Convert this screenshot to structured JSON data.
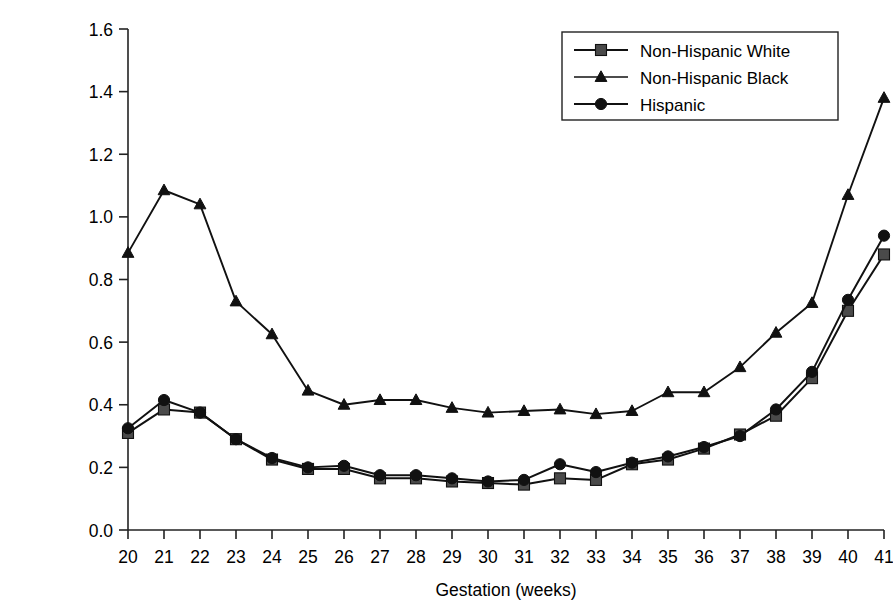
{
  "chart_data": {
    "type": "line",
    "title": "",
    "xlabel": "Gestation (weeks)",
    "ylabel": "Hazard of stillbirth\nper 1,000 ongoing pregnancies",
    "xlim": [
      20,
      41
    ],
    "ylim": [
      0.0,
      1.6
    ],
    "grid": false,
    "legend_position": "top-right",
    "xticks": [
      "20",
      "21",
      "22",
      "23",
      "24",
      "25",
      "26",
      "27",
      "28",
      "29",
      "30",
      "31",
      "32",
      "33",
      "34",
      "35",
      "36",
      "37",
      "38",
      "39",
      "40",
      "41"
    ],
    "yticks": [
      "0.0",
      "0.2",
      "0.4",
      "0.6",
      "0.8",
      "1.0",
      "1.2",
      "1.4",
      "1.6"
    ],
    "x": [
      20,
      21,
      22,
      23,
      24,
      25,
      26,
      27,
      28,
      29,
      30,
      31,
      32,
      33,
      34,
      35,
      36,
      37,
      38,
      39,
      40,
      41
    ],
    "series": [
      {
        "name": "Non-Hispanic White",
        "marker": "square",
        "color": "#111111",
        "marker_fill": "#4a4a4a",
        "values": [
          0.31,
          0.385,
          0.375,
          0.29,
          0.225,
          0.195,
          0.195,
          0.165,
          0.165,
          0.155,
          0.15,
          0.145,
          0.165,
          0.16,
          0.21,
          0.225,
          0.26,
          0.305,
          0.365,
          0.485,
          0.7,
          0.88
        ]
      },
      {
        "name": "Non-Hispanic Black",
        "marker": "triangle",
        "color": "#111111",
        "marker_fill": "#111111",
        "values": [
          0.885,
          1.085,
          1.04,
          0.73,
          0.625,
          0.445,
          0.4,
          0.415,
          0.415,
          0.39,
          0.375,
          0.38,
          0.385,
          0.37,
          0.38,
          0.44,
          0.44,
          0.52,
          0.63,
          0.725,
          1.07,
          1.38
        ]
      },
      {
        "name": "Hispanic",
        "marker": "circle",
        "color": "#111111",
        "marker_fill": "#111111",
        "values": [
          0.325,
          0.415,
          0.375,
          0.29,
          0.23,
          0.2,
          0.205,
          0.175,
          0.175,
          0.165,
          0.155,
          0.16,
          0.21,
          0.185,
          0.215,
          0.235,
          0.265,
          0.3,
          0.385,
          0.505,
          0.735,
          0.94
        ]
      }
    ]
  },
  "legend": {
    "entries": [
      {
        "label": "Non-Hispanic White"
      },
      {
        "label": "Non-Hispanic Black"
      },
      {
        "label": "Hispanic"
      }
    ]
  }
}
